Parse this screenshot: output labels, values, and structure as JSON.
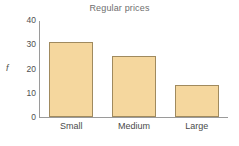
{
  "chart_data": {
    "type": "bar",
    "title": "Regular prices",
    "xlabel": "",
    "ylabel": "f",
    "categories": [
      "Small",
      "Medium",
      "Large"
    ],
    "values": [
      31,
      25,
      13
    ],
    "yticks": [
      0,
      10,
      20,
      30,
      40
    ],
    "ylim": [
      0,
      40
    ],
    "grid": false,
    "legend": false,
    "series": [
      {
        "name": "Frequency",
        "values": [
          31,
          25,
          13
        ]
      }
    ]
  },
  "style": {
    "bar_fill": "#f5d79e",
    "bar_border": "#a08a5e",
    "axis_color": "#9a9a9a",
    "title_color": "#6e6e6e",
    "label_color": "#4a4a4a",
    "background": "#ffffff"
  }
}
